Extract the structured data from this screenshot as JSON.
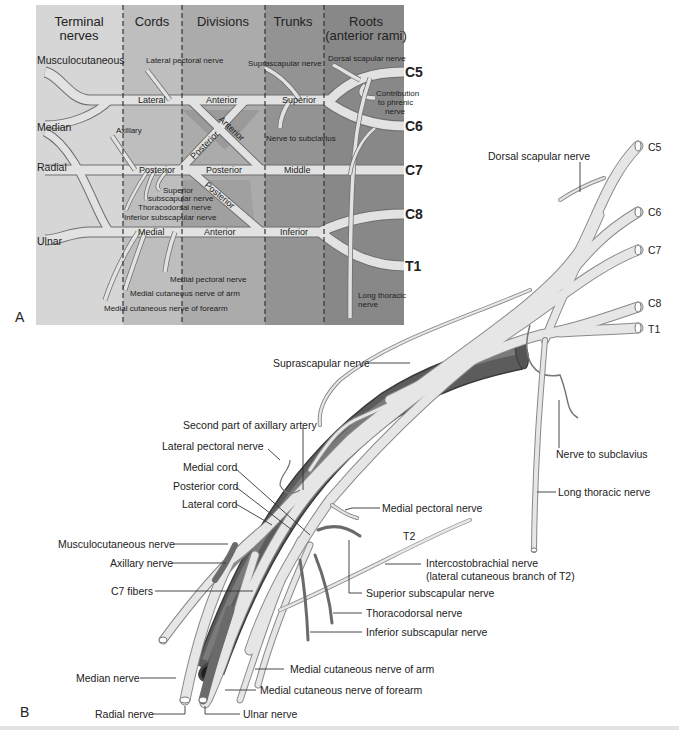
{
  "panel_a": {
    "letter": "A",
    "columns": [
      {
        "label_line1": "Terminal",
        "label_line2": "nerves",
        "color": "#d4d4d4"
      },
      {
        "label_line1": "Cords",
        "label_line2": "",
        "color": "#bdbdbd"
      },
      {
        "label_line1": "Divisions",
        "label_line2": "",
        "color": "#a9a9a9"
      },
      {
        "label_line1": "Trunks",
        "label_line2": "",
        "color": "#8f8f8f"
      },
      {
        "label_line1": "Roots",
        "label_line2": "(anterior rami)",
        "color": "#858585"
      }
    ],
    "terminal_nerves": {
      "musculocutaneous": "Musculocutaneous",
      "median": "Median",
      "radial": "Radial",
      "ulnar": "Ulnar"
    },
    "cords": {
      "lateral": "Lateral",
      "posterior": "Posterior",
      "medial": "Medial"
    },
    "divisions": {
      "anterior_top": "Anterior",
      "anterior_diag": "Anterior",
      "posterior_diag_up": "Posterior",
      "posterior_mid": "Posterior",
      "posterior_diag_down": "Posterior",
      "anterior_bottom": "Anterior"
    },
    "trunks": {
      "superior": "Superior",
      "middle": "Middle",
      "inferior": "Inferior"
    },
    "roots": [
      "C5",
      "C6",
      "C7",
      "C8",
      "T1"
    ],
    "branches": {
      "lateral_pectoral": "Lateral pectoral nerve",
      "axillary": "Axillary",
      "superior_subscapular_1": "Superior",
      "superior_subscapular_2": "subscapular nerve",
      "thoracodorsal": "Thoracodorsal nerve",
      "inferior_subscapular": "Inferior subscapular nerve",
      "medial_pectoral": "Medial pectoral nerve",
      "medial_cutaneous_arm": "Medial cutaneous nerve of arm",
      "medial_cutaneous_forearm": "Medial cutaneous nerve of forearm",
      "suprascapular": "Suprascapular nerve",
      "nerve_to_subclavius": "Nerve to subclavius",
      "dorsal_scapular": "Dorsal scapular nerve",
      "phrenic_1": "Contribution",
      "phrenic_2": "to phrenic",
      "phrenic_3": "nerve",
      "long_thoracic_1": "Long thoracic",
      "long_thoracic_2": "nerve"
    }
  },
  "panel_b": {
    "letter": "B",
    "roots": [
      "C5",
      "C6",
      "C7",
      "C8",
      "T1"
    ],
    "labels": {
      "dorsal_scapular": "Dorsal scapular nerve",
      "suprascapular": "Suprascapular nerve",
      "second_part_axillary_artery": "Second part of axillary artery",
      "lateral_pectoral": "Lateral pectoral nerve",
      "medial_cord": "Medial cord",
      "posterior_cord": "Posterior cord",
      "lateral_cord": "Lateral cord",
      "musculocutaneous": "Musculocutaneous nerve",
      "axillary": "Axillary nerve",
      "c7_fibers": "C7 fibers",
      "median": "Median nerve",
      "radial": "Radial nerve",
      "ulnar": "Ulnar nerve",
      "nerve_to_subclavius": "Nerve to subclavius",
      "long_thoracic": "Long thoracic nerve",
      "medial_pectoral": "Medial pectoral nerve",
      "t2": "T2",
      "intercostobrachial_1": "Intercostobrachial nerve",
      "intercostobrachial_2": "(lateral cutaneous branch of T2)",
      "superior_subscapular": "Superior subscapular nerve",
      "thoracodorsal": "Thoracodorsal nerve",
      "inferior_subscapular": "Inferior subscapular nerve",
      "medial_cutaneous_arm": "Medial cutaneous nerve of arm",
      "medial_cutaneous_forearm": "Medial cutaneous nerve of forearm"
    },
    "colors": {
      "nerve": "#e6e6e6",
      "artery": "#5c5c5c",
      "artery_highlight": "#7a7a7a"
    }
  }
}
